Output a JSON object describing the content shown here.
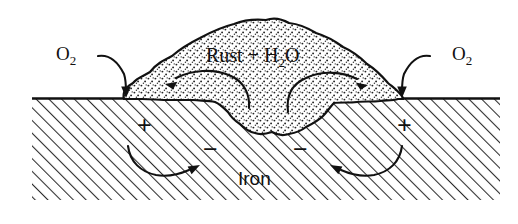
{
  "figure": {
    "background_color": "#ffffff",
    "ink_color": "#111111",
    "width": 518,
    "height": 224
  },
  "labels": {
    "oxygen_left": "O",
    "oxygen_left_sub": "2",
    "oxygen_right": "O",
    "oxygen_right_sub": "2",
    "rust_text": "Rust + H",
    "rust_sub": "2",
    "rust_tail": "O",
    "iron": "Iron",
    "anode_left_sign": "+",
    "anode_right_sign": "+",
    "cathode_left_sign": "−",
    "cathode_right_sign": "−"
  },
  "regions": {
    "metal": {
      "name": "Iron",
      "fill_pattern": "diagonal-hatch",
      "pattern_color": "#2b2b2b",
      "top_y": 98,
      "bottom_y": 200,
      "left_x": 32,
      "right_x": 500
    },
    "deposit": {
      "name": "Rust + H2O",
      "fill_pattern": "stipple",
      "pattern_color": "#222222",
      "description": "irregular stippled blob of rust and water above and below the iron surface"
    }
  },
  "arrows": [
    {
      "name": "oxygen-left-arrow",
      "from_label": "O2 (left)",
      "to": "left edge of rust deposit at iron surface",
      "direction": "down-right"
    },
    {
      "name": "oxygen-right-arrow",
      "from_label": "O2 (right)",
      "to": "right edge of rust deposit at iron surface",
      "direction": "down-left"
    },
    {
      "name": "rust-flow-left-arrow",
      "from_label": "center of deposit",
      "to": "left anode region",
      "direction": "left"
    },
    {
      "name": "rust-flow-right-arrow",
      "from_label": "center of deposit",
      "to": "right anode region",
      "direction": "right"
    },
    {
      "name": "electron-flow-left-arrow",
      "from_label": "left + anode",
      "to": "left − cathode",
      "direction": "right"
    },
    {
      "name": "electron-flow-right-arrow",
      "from_label": "right + anode",
      "to": "right − cathode",
      "direction": "left"
    }
  ]
}
